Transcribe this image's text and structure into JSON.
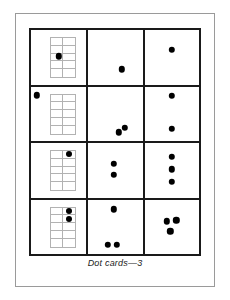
{
  "page": {
    "caption": "Dot cards—3",
    "colors": {
      "dot": "#000000",
      "table_border": "#1a1a1a",
      "tenframe_border": "#b2b2b2",
      "page_frame": "#9a9a9a",
      "background": "#ffffff"
    }
  },
  "grid": {
    "columns": 3,
    "rows": 4,
    "column_types": [
      "ten-frame",
      "scattered-dots",
      "scattered-dots"
    ]
  },
  "cards": [
    {
      "row": 1,
      "tenframe": {
        "rows": 5,
        "cols": 2,
        "filled_cells": [],
        "count": 0
      },
      "frame_outside_dots": [
        {
          "x": 50,
          "y": 48,
          "r": 3.2
        }
      ],
      "frame_card_count": 1,
      "middle_dots": [
        {
          "x": 62,
          "y": 72,
          "r": 3.2
        }
      ],
      "middle_count": 1,
      "right_dots": [
        {
          "x": 50,
          "y": 36,
          "r": 3.2
        }
      ],
      "right_count": 1
    },
    {
      "row": 2,
      "tenframe": {
        "rows": 5,
        "cols": 2,
        "filled_cells": [],
        "count": 0
      },
      "frame_outside_dots": [
        {
          "x": 10,
          "y": 16,
          "r": 3.2
        }
      ],
      "frame_card_count": 1,
      "middle_dots": [
        {
          "x": 56,
          "y": 84,
          "r": 3.2
        },
        {
          "x": 68,
          "y": 76,
          "r": 3.2
        }
      ],
      "middle_count": 2,
      "right_dots": [
        {
          "x": 50,
          "y": 17,
          "r": 3.2
        },
        {
          "x": 50,
          "y": 78,
          "r": 3.2
        }
      ],
      "right_count": 2
    },
    {
      "row": 3,
      "tenframe": {
        "rows": 5,
        "cols": 2,
        "filled_cells": [
          {
            "r": 1,
            "c": 2
          }
        ],
        "count": 1
      },
      "frame_outside_dots": [],
      "frame_card_count": 1,
      "middle_dots": [
        {
          "x": 47,
          "y": 38,
          "r": 3.2
        },
        {
          "x": 47,
          "y": 58,
          "r": 3.2
        }
      ],
      "middle_count": 2,
      "right_dots": [
        {
          "x": 50,
          "y": 25,
          "r": 3.2
        },
        {
          "x": 50,
          "y": 48,
          "r": 3.2
        },
        {
          "x": 50,
          "y": 71,
          "r": 3.2
        }
      ],
      "right_count": 3
    },
    {
      "row": 4,
      "tenframe": {
        "rows": 5,
        "cols": 2,
        "filled_cells": [
          {
            "r": 1,
            "c": 2
          },
          {
            "r": 2,
            "c": 2
          }
        ],
        "count": 2
      },
      "frame_outside_dots": [],
      "frame_card_count": 2,
      "middle_dots": [
        {
          "x": 47,
          "y": 18,
          "r": 3.2
        },
        {
          "x": 36,
          "y": 83,
          "r": 3.2
        },
        {
          "x": 53,
          "y": 83,
          "r": 3.2
        }
      ],
      "middle_count": 3,
      "right_dots": [
        {
          "x": 41,
          "y": 40,
          "r": 3.2
        },
        {
          "x": 58,
          "y": 38,
          "r": 3.2
        },
        {
          "x": 47,
          "y": 58,
          "r": 3.2
        }
      ],
      "right_count": 3
    }
  ]
}
